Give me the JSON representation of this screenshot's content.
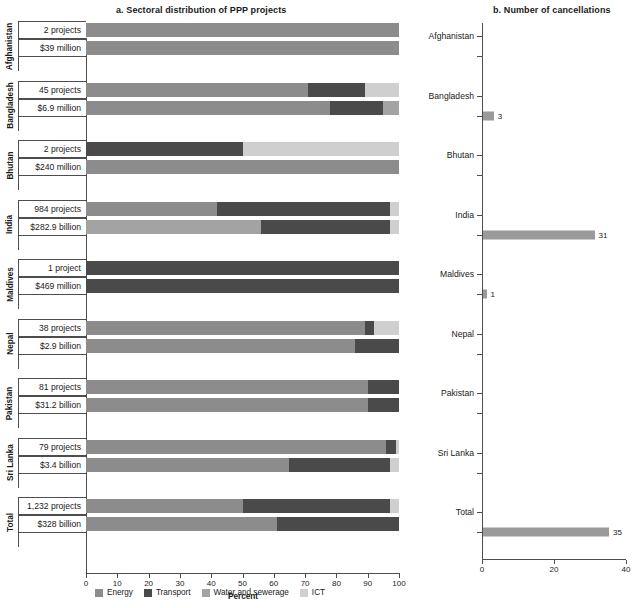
{
  "panels": {
    "a": {
      "title": "a. Sectoral distribution of PPP projects",
      "xlabel": "Percent"
    },
    "b": {
      "title": "b. Number of cancellations"
    }
  },
  "legend": [
    {
      "label": "Energy",
      "color": "#8c8c8c",
      "key": "energy"
    },
    {
      "label": "Transport",
      "color": "#4a4a4a",
      "key": "transport"
    },
    {
      "label": "Water and sewerage",
      "color": "#a3a3a3",
      "key": "water"
    },
    {
      "label": "ICT",
      "color": "#cfcfcf",
      "key": "ict"
    }
  ],
  "chart_data": [
    {
      "type": "bar",
      "title": "a. Sectoral distribution of PPP projects",
      "xlabel": "Percent",
      "ylabel": "",
      "xlim": [
        0,
        100
      ],
      "xticks": [
        0,
        10,
        20,
        30,
        40,
        50,
        60,
        70,
        80,
        90,
        100
      ],
      "grid": false,
      "orientation": "horizontal",
      "stacked": true,
      "legend_position": "bottom",
      "series_names": [
        "Energy",
        "Transport",
        "Water and sewerage",
        "ICT"
      ],
      "groups": [
        {
          "country": "Afghanistan",
          "rows": [
            {
              "label": "2 projects",
              "energy": 100,
              "transport": 0,
              "water": 0,
              "ict": 0
            },
            {
              "label": "$39 million",
              "energy": 100,
              "transport": 0,
              "water": 0,
              "ict": 0
            }
          ]
        },
        {
          "country": "Bangladesh",
          "rows": [
            {
              "label": "45 projects",
              "energy": 71,
              "transport": 18,
              "water": 0,
              "ict": 11
            },
            {
              "label": "$6.9 million",
              "energy": 78,
              "transport": 17,
              "water": 5,
              "ict": 0
            }
          ]
        },
        {
          "country": "Bhutan",
          "rows": [
            {
              "label": "2 projects",
              "energy": 0,
              "transport": 50,
              "water": 0,
              "ict": 50
            },
            {
              "label": "$240 million",
              "energy": 100,
              "transport": 0,
              "water": 0,
              "ict": 0
            }
          ]
        },
        {
          "country": "India",
          "rows": [
            {
              "label": "984 projects",
              "energy": 42,
              "transport": 55,
              "water": 0,
              "ict": 3
            },
            {
              "label": "$282.9 billion",
              "energy": 0,
              "transport": 41,
              "water": 56,
              "ict": 3
            }
          ]
        },
        {
          "country": "Maldives",
          "rows": [
            {
              "label": "1 project",
              "energy": 0,
              "transport": 100,
              "water": 0,
              "ict": 0
            },
            {
              "label": "$469 million",
              "energy": 0,
              "transport": 100,
              "water": 0,
              "ict": 0
            }
          ]
        },
        {
          "country": "Nepal",
          "rows": [
            {
              "label": "38 projects",
              "energy": 89,
              "transport": 3,
              "water": 0,
              "ict": 8
            },
            {
              "label": "$2.9 billion",
              "energy": 86,
              "transport": 14,
              "water": 0,
              "ict": 0
            }
          ]
        },
        {
          "country": "Pakistan",
          "rows": [
            {
              "label": "81 projects",
              "energy": 90,
              "transport": 10,
              "water": 0,
              "ict": 0
            },
            {
              "label": "$31.2 billion",
              "energy": 90,
              "transport": 10,
              "water": 0,
              "ict": 0
            }
          ]
        },
        {
          "country": "Sri Lanka",
          "rows": [
            {
              "label": "79 projects",
              "energy": 96,
              "transport": 3,
              "water": 0,
              "ict": 1
            },
            {
              "label": "$3.4 billion",
              "energy": 65,
              "transport": 32,
              "water": 0,
              "ict": 3
            }
          ]
        },
        {
          "country": "Total",
          "rows": [
            {
              "label": "1,232 projects",
              "energy": 50,
              "transport": 47,
              "water": 0,
              "ict": 3
            },
            {
              "label": "$328 billion",
              "energy": 61,
              "transport": 39,
              "water": 0,
              "ict": 0
            }
          ]
        }
      ]
    },
    {
      "type": "bar",
      "title": "b. Number of cancellations",
      "xlabel": "",
      "ylabel": "",
      "xlim": [
        0,
        40
      ],
      "xticks": [
        0,
        20,
        40
      ],
      "grid": false,
      "orientation": "horizontal",
      "categories": [
        "Afghanistan",
        "Bangladesh",
        "Bhutan",
        "India",
        "Maldives",
        "Nepal",
        "Pakistan",
        "Sri Lanka",
        "Total"
      ],
      "values": [
        0,
        3,
        0,
        31,
        1,
        0,
        0,
        0,
        35
      ],
      "value_labels": [
        "",
        "3",
        "",
        "31",
        "1",
        "",
        "",
        "",
        "35"
      ],
      "bar_color": "#9a9a9a"
    }
  ]
}
